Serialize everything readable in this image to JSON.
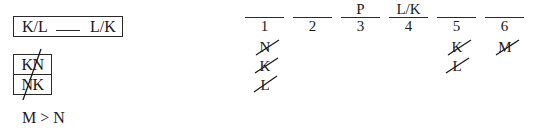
{
  "constraints": {
    "box_rule": {
      "left": "K/L",
      "blank": "___",
      "right": "L/K"
    },
    "stack_rule": {
      "rows": [
        "KN",
        "NK"
      ],
      "crossed_out": true
    },
    "inequality": "M > N"
  },
  "slots": [
    {
      "number": "1",
      "value": "",
      "eliminated": [
        "N",
        "K",
        "L"
      ]
    },
    {
      "number": "2",
      "value": "",
      "eliminated": []
    },
    {
      "number": "3",
      "value": "P",
      "eliminated": []
    },
    {
      "number": "4",
      "value": "L/K",
      "eliminated": []
    },
    {
      "number": "5",
      "value": "",
      "eliminated": [
        "K",
        "L"
      ]
    },
    {
      "number": "6",
      "value": "",
      "eliminated": [
        "M"
      ]
    }
  ],
  "colors": {
    "ink": "#1a1a1a",
    "background": "#ffffff"
  }
}
